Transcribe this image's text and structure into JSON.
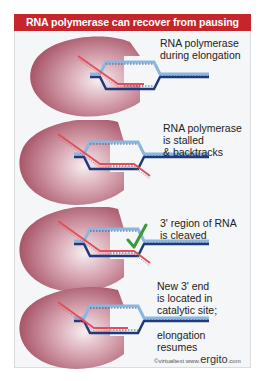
{
  "title": "RNA polymerase can recover from pausing",
  "colors": {
    "title_bg": "#c4262b",
    "title_text": "#ffffff",
    "panel_bg": "#f4f6f8",
    "polymerase": "#b86a7a",
    "rna_strand": "#e0505a",
    "dna_template": "#1f3a7a",
    "dna_nontemplate": "#8ab6e0",
    "checkmark": "#3a9a3a"
  },
  "stages": [
    {
      "id": "elongation",
      "caption_lines": [
        "RNA polymerase",
        "during elongation"
      ],
      "state": "elongating"
    },
    {
      "id": "stalled",
      "caption_lines": [
        "RNA polymerase",
        "is stalled",
        "& backtracks"
      ],
      "state": "backtracked"
    },
    {
      "id": "cleaved",
      "caption_lines": [
        "3' region of RNA",
        "is cleaved"
      ],
      "state": "cleaved",
      "marker": "check-icon"
    },
    {
      "id": "resumes",
      "caption_lines": [
        "New 3' end",
        "is located in",
        "catalytic site;",
        "elongation",
        "resumes"
      ],
      "state": "resumed"
    }
  ],
  "footer": {
    "copyright": "©virtualtext",
    "site_prefix": "www.",
    "site_main": "ergito",
    "site_suffix": ".com"
  }
}
